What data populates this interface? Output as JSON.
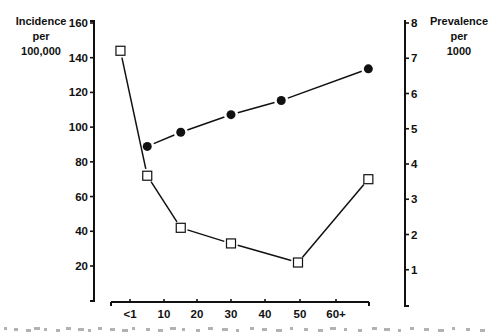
{
  "chart_data": {
    "type": "line",
    "title": "",
    "xlabel": "",
    "x_tick_labels": [
      "<1",
      "10",
      "20",
      "30",
      "40",
      "50",
      "60+"
    ],
    "x_ticks": [
      0,
      10,
      20,
      30,
      40,
      50,
      60
    ],
    "y_left": {
      "label_lines": [
        "Incidence",
        "per",
        "100,000"
      ],
      "ticks": [
        20,
        40,
        60,
        80,
        100,
        120,
        140,
        160
      ],
      "range": [
        0,
        160
      ]
    },
    "y_right": {
      "label_lines": [
        "Prevalence",
        "per",
        "1000"
      ],
      "ticks": [
        1,
        2,
        3,
        4,
        5,
        6,
        7,
        8
      ],
      "range": [
        0,
        8
      ]
    },
    "grid": false,
    "legend": "none",
    "series": [
      {
        "name": "Incidence per 100,000",
        "axis": "left",
        "marker": "open-square",
        "line": "solid",
        "x": [
          -3,
          5,
          15,
          30,
          50,
          71
        ],
        "values": [
          144,
          72,
          42,
          33,
          22,
          70
        ]
      },
      {
        "name": "Prevalence per 1000",
        "axis": "right",
        "marker": "filled-circle",
        "line": "solid",
        "x": [
          5,
          15,
          30,
          45,
          71
        ],
        "values": [
          4.5,
          4.9,
          5.4,
          5.8,
          6.7
        ]
      }
    ]
  },
  "colors": {
    "ink": "#111111",
    "background": "#ffffff"
  }
}
